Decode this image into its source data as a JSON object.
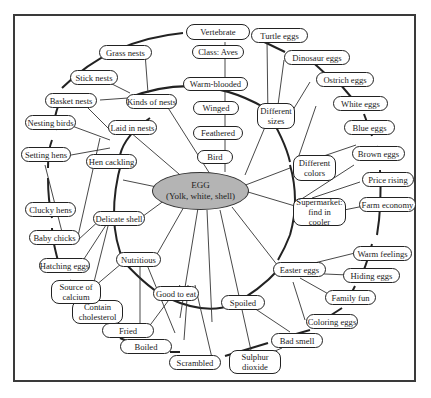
{
  "diagram": {
    "type": "concept map / web",
    "center": {
      "title": "EGG",
      "subtitle": "(Yolk, white, shell)",
      "fill": "#b4b4b4"
    },
    "nodes": {
      "vertebrate": "Vertebrate",
      "class_aves": "Class: Aves",
      "warm_blooded": "Warm-blooded",
      "winged": "Winged",
      "feathered": "Feathered",
      "bird": "Bird",
      "turtle_eggs": "Turtle eggs",
      "dinosaur_eggs": "Dinosaur eggs",
      "ostrich_eggs": "Ostrich eggs",
      "white_eggs": "White eggs",
      "blue_eggs": "Blue eggs",
      "brown_eggs": "Brown eggs",
      "price_rising": "Price rising",
      "farm_economy": "Farm economy",
      "warm_feelings": "Warm feelings",
      "hiding_eggs": "Hiding eggs",
      "family_fun": "Family fun",
      "coloring_eggs": "Coloring eggs",
      "bad_smell": "Bad smell",
      "sulphur_dioxide_1": "Sulphur",
      "sulphur_dioxide_2": "dioxide",
      "scrambled": "Scrambled",
      "boiled": "Boiled",
      "fried": "Fried",
      "contain_cholesterol_1": "Contain",
      "contain_cholesterol_2": "cholesterol",
      "source_of_calcium_1": "Source of",
      "source_of_calcium_2": "calcium",
      "hatching_eggs": "Hatching eggs",
      "baby_chicks": "Baby chicks",
      "clucky_hens": "Clucky hens",
      "setting_hens": "Setting hens",
      "nesting_birds": "Nesting birds",
      "basket_nests": "Basket nests",
      "stick_nests": "Stick nests",
      "grass_nests": "Grass nests",
      "kinds_of_nests": "Kinds of nests",
      "laid_in_nests": "Laid in nests",
      "hen_cackling": "Hen cackling",
      "delicate_shell": "Delicate shell",
      "nutritious": "Nutritious",
      "good_to_eat": "Good to eat",
      "spoiled": "Spoiled",
      "easter_eggs": "Easter eggs",
      "supermarket_1": "Supermarket:",
      "supermarket_2": "find in cooler",
      "different_colors_1": "Different",
      "different_colors_2": "colors",
      "different_sizes_1": "Different",
      "different_sizes_2": "sizes"
    }
  }
}
